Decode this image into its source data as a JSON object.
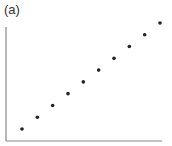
{
  "panel_label": "(a)",
  "colors": {
    "axis": "#888888",
    "marker": "#222222"
  },
  "chart_data": {
    "type": "scatter",
    "title": "(a)",
    "xlabel": "",
    "ylabel": "",
    "grid": false,
    "legend": null,
    "xlim": [
      0,
      11
    ],
    "ylim": [
      0,
      11
    ],
    "x": [
      1,
      2,
      3,
      4,
      5,
      6,
      7,
      8,
      9,
      10
    ],
    "y": [
      1,
      2,
      3,
      4,
      5,
      6,
      7,
      8,
      9,
      10
    ],
    "series": [
      {
        "name": "",
        "x": [
          1,
          2,
          3,
          4,
          5,
          6,
          7,
          8,
          9,
          10
        ],
        "y": [
          1,
          2,
          3,
          4,
          5,
          6,
          7,
          8,
          9,
          10
        ]
      }
    ]
  }
}
